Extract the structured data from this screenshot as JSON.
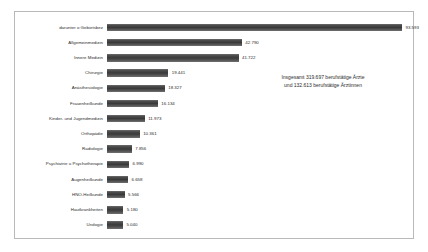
{
  "chart_data": {
    "type": "bar",
    "orientation": "horizontal",
    "title": "",
    "subtitle": "",
    "xlabel": "",
    "ylabel": "",
    "grid": false,
    "legend": "none",
    "xlim": [
      0,
      93593
    ],
    "categories": [
      "darunter o Gebietsbez",
      "Allgemeinmedizin",
      "Innere Medizin",
      "Chirurgie",
      "Anästhesiologie",
      "Frauenheilkunde",
      "Kinder- und Jugendmedizin",
      "Orthopädie",
      "Radiologie",
      "Psychiatrie u Psychotherapie",
      "Augenheilkunde",
      "HNO-Heilkunde",
      "Hautkrankheiten",
      "Urologie"
    ],
    "values": [
      93593,
      42790,
      41722,
      19441,
      18327,
      16134,
      11973,
      10361,
      7856,
      6990,
      6658,
      5566,
      5180,
      5040
    ],
    "value_labels": [
      "93.593",
      "42.790",
      "41.722",
      "19.441",
      "18.327",
      "16.134",
      "11.973",
      "10.361",
      "7.856",
      "6.990",
      "6.658",
      "5.566",
      "5.180",
      "5.040"
    ],
    "annotation": {
      "line1": "Insgesamt 319.697 berufstätige Ärzte",
      "line2": "und 132.613 berufstätige Ärztinnen"
    },
    "colors": {
      "bar": "#4a4a4a",
      "bar_highlight": "#6d6d6d",
      "text": "#2b2b2b",
      "frame": "#b9b9b9",
      "background": "#ffffff"
    }
  }
}
